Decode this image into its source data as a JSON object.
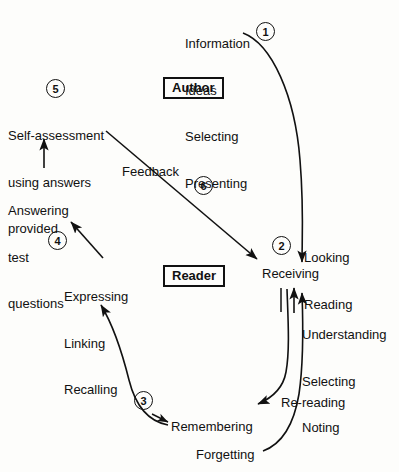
{
  "diagram": {
    "type": "cycle-flow-diagram",
    "background_color": "#fdfdfb",
    "ink_color": "#111111",
    "roles": [
      {
        "id": "author",
        "label": "Author",
        "boxed": true,
        "x": 163,
        "y": 77
      },
      {
        "id": "reader",
        "label": "Reader",
        "boxed": true,
        "x": 163,
        "y": 265
      }
    ],
    "text_blocks": [
      {
        "id": "author-activities",
        "lines": [
          "Information",
          "Ideas",
          "Selecting",
          "Presenting"
        ],
        "x": 185,
        "y": 5,
        "align": "left"
      },
      {
        "id": "step5-label",
        "lines": [
          "Self-assessment",
          "using answers",
          "provided"
        ],
        "x": 8,
        "y": 97,
        "align": "left"
      },
      {
        "id": "answering-test-questions",
        "lines": [
          "Answering",
          "test",
          "questions"
        ],
        "x": 8,
        "y": 172,
        "align": "left"
      },
      {
        "id": "feedback-label",
        "lines": [
          "Feedback"
        ],
        "x": 122,
        "y": 164,
        "align": "left"
      },
      {
        "id": "looking-reading",
        "lines": [
          "Looking",
          "Reading"
        ],
        "x": 304,
        "y": 219,
        "align": "left"
      },
      {
        "id": "step4-label",
        "lines": [
          "Expressing",
          "Linking",
          "Recalling"
        ],
        "x": 64,
        "y": 258,
        "align": "left"
      },
      {
        "id": "receiving-label",
        "lines": [
          "Receiving"
        ],
        "x": 262,
        "y": 266,
        "align": "left"
      },
      {
        "id": "understanding-selecting-noting",
        "lines": [
          "Understanding",
          "Selecting",
          "Noting"
        ],
        "x": 302,
        "y": 296,
        "align": "left"
      },
      {
        "id": "re-reading-label",
        "lines": [
          "Re-reading"
        ],
        "x": 281,
        "y": 395,
        "align": "left"
      },
      {
        "id": "remembering-label",
        "lines": [
          "Remembering"
        ],
        "x": 171,
        "y": 419,
        "align": "left"
      },
      {
        "id": "forgetting-label",
        "lines": [
          "Forgetting"
        ],
        "x": 196,
        "y": 447,
        "align": "left"
      }
    ],
    "step_numbers": [
      {
        "id": "step-1",
        "label": "1",
        "x": 256,
        "y": 22,
        "describes": "Author presents information; flow to Reader"
      },
      {
        "id": "step-2",
        "label": "2",
        "x": 272,
        "y": 236,
        "describes": "Receiving: looking and reading"
      },
      {
        "id": "step-3",
        "label": "3",
        "x": 134,
        "y": 391,
        "describes": "Remembering feeds recall"
      },
      {
        "id": "step-4",
        "label": "4",
        "x": 48,
        "y": 231,
        "describes": "Expressing, linking, recalling"
      },
      {
        "id": "step-5",
        "label": "5",
        "x": 46,
        "y": 79,
        "describes": "Self-assessment using answers provided"
      },
      {
        "id": "step-6",
        "label": "6",
        "x": 194,
        "y": 176,
        "describes": "Feedback from reader back to receiving"
      }
    ],
    "connectors": [
      {
        "id": "arrow-author-to-receiving",
        "from": "Presenting",
        "to": "Receiving",
        "style": "curved",
        "step": "1"
      },
      {
        "id": "arrow-receiving-to-remembering",
        "from": "Receiving",
        "to": "Remembering",
        "style": "curved",
        "step": "2"
      },
      {
        "id": "arrow-forgetting-to-receiving",
        "from": "Forgetting",
        "to": "Receiving",
        "style": "curved",
        "label": "Re-reading"
      },
      {
        "id": "arrow-remembering-to-recalling",
        "from": "Remembering",
        "to": "Recalling",
        "style": "curved",
        "step": "3"
      },
      {
        "id": "arrow-recalling-to-answering",
        "from": "Expressing Linking Recalling",
        "to": "Answering test questions",
        "style": "straight",
        "step": "4"
      },
      {
        "id": "arrow-answering-to-selfassessment",
        "from": "Answering test questions",
        "to": "Self-assessment using answers provided",
        "style": "straight",
        "step": "5"
      },
      {
        "id": "arrow-feedback-to-receiving",
        "from": "Feedback",
        "to": "Receiving",
        "style": "straight",
        "step": "6"
      }
    ]
  }
}
